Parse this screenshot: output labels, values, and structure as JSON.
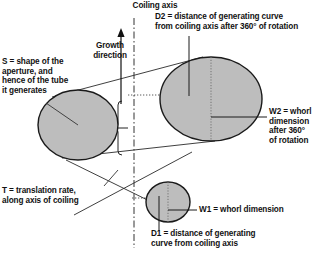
{
  "diagram": {
    "title": "Coiling axis",
    "bg_color": "#ffffff",
    "shape_fill": "#bdbdbd",
    "stroke_color": "#1a1a1a",
    "labels": {
      "coiling_axis": "Coiling axis",
      "growth_direction": "Growth\ndirection",
      "d2": "D2 = distance of generating curve\nfrom coiling axis after 360° of rotation",
      "s": "S = shape of the\naperture, and\nhence of the tube\nit generates",
      "w2": "W2 = whorl\ndimension\nafter 360°\nof rotation",
      "t": "T = translation rate,\nalong axis of coiling",
      "w1": "W1 = whorl dimension",
      "d1": "D1 = distance of generating\ncurve from coiling axis"
    },
    "parameters": [
      {
        "symbol": "S",
        "meaning": "shape of the aperture, and hence of the tube it generates"
      },
      {
        "symbol": "W1",
        "meaning": "whorl dimension"
      },
      {
        "symbol": "W2",
        "meaning": "whorl dimension after 360° of rotation"
      },
      {
        "symbol": "D1",
        "meaning": "distance of generating curve from coiling axis"
      },
      {
        "symbol": "D2",
        "meaning": "distance of generating curve from coiling axis after 360° of rotation"
      },
      {
        "symbol": "T",
        "meaning": "translation rate, along axis of coiling"
      }
    ],
    "shapes": {
      "aperture_left": {
        "cx": 78,
        "cy": 125,
        "rx": 40,
        "ry": 35
      },
      "whorl_large": {
        "cx": 211,
        "cy": 99,
        "rx": 51,
        "ry": 42
      },
      "whorl_small": {
        "cx": 168,
        "cy": 202,
        "rx": 22,
        "ry": 20
      }
    },
    "axis": {
      "x": 134,
      "y_top": 18,
      "y_bottom": 248,
      "style": "dash-dot"
    }
  }
}
